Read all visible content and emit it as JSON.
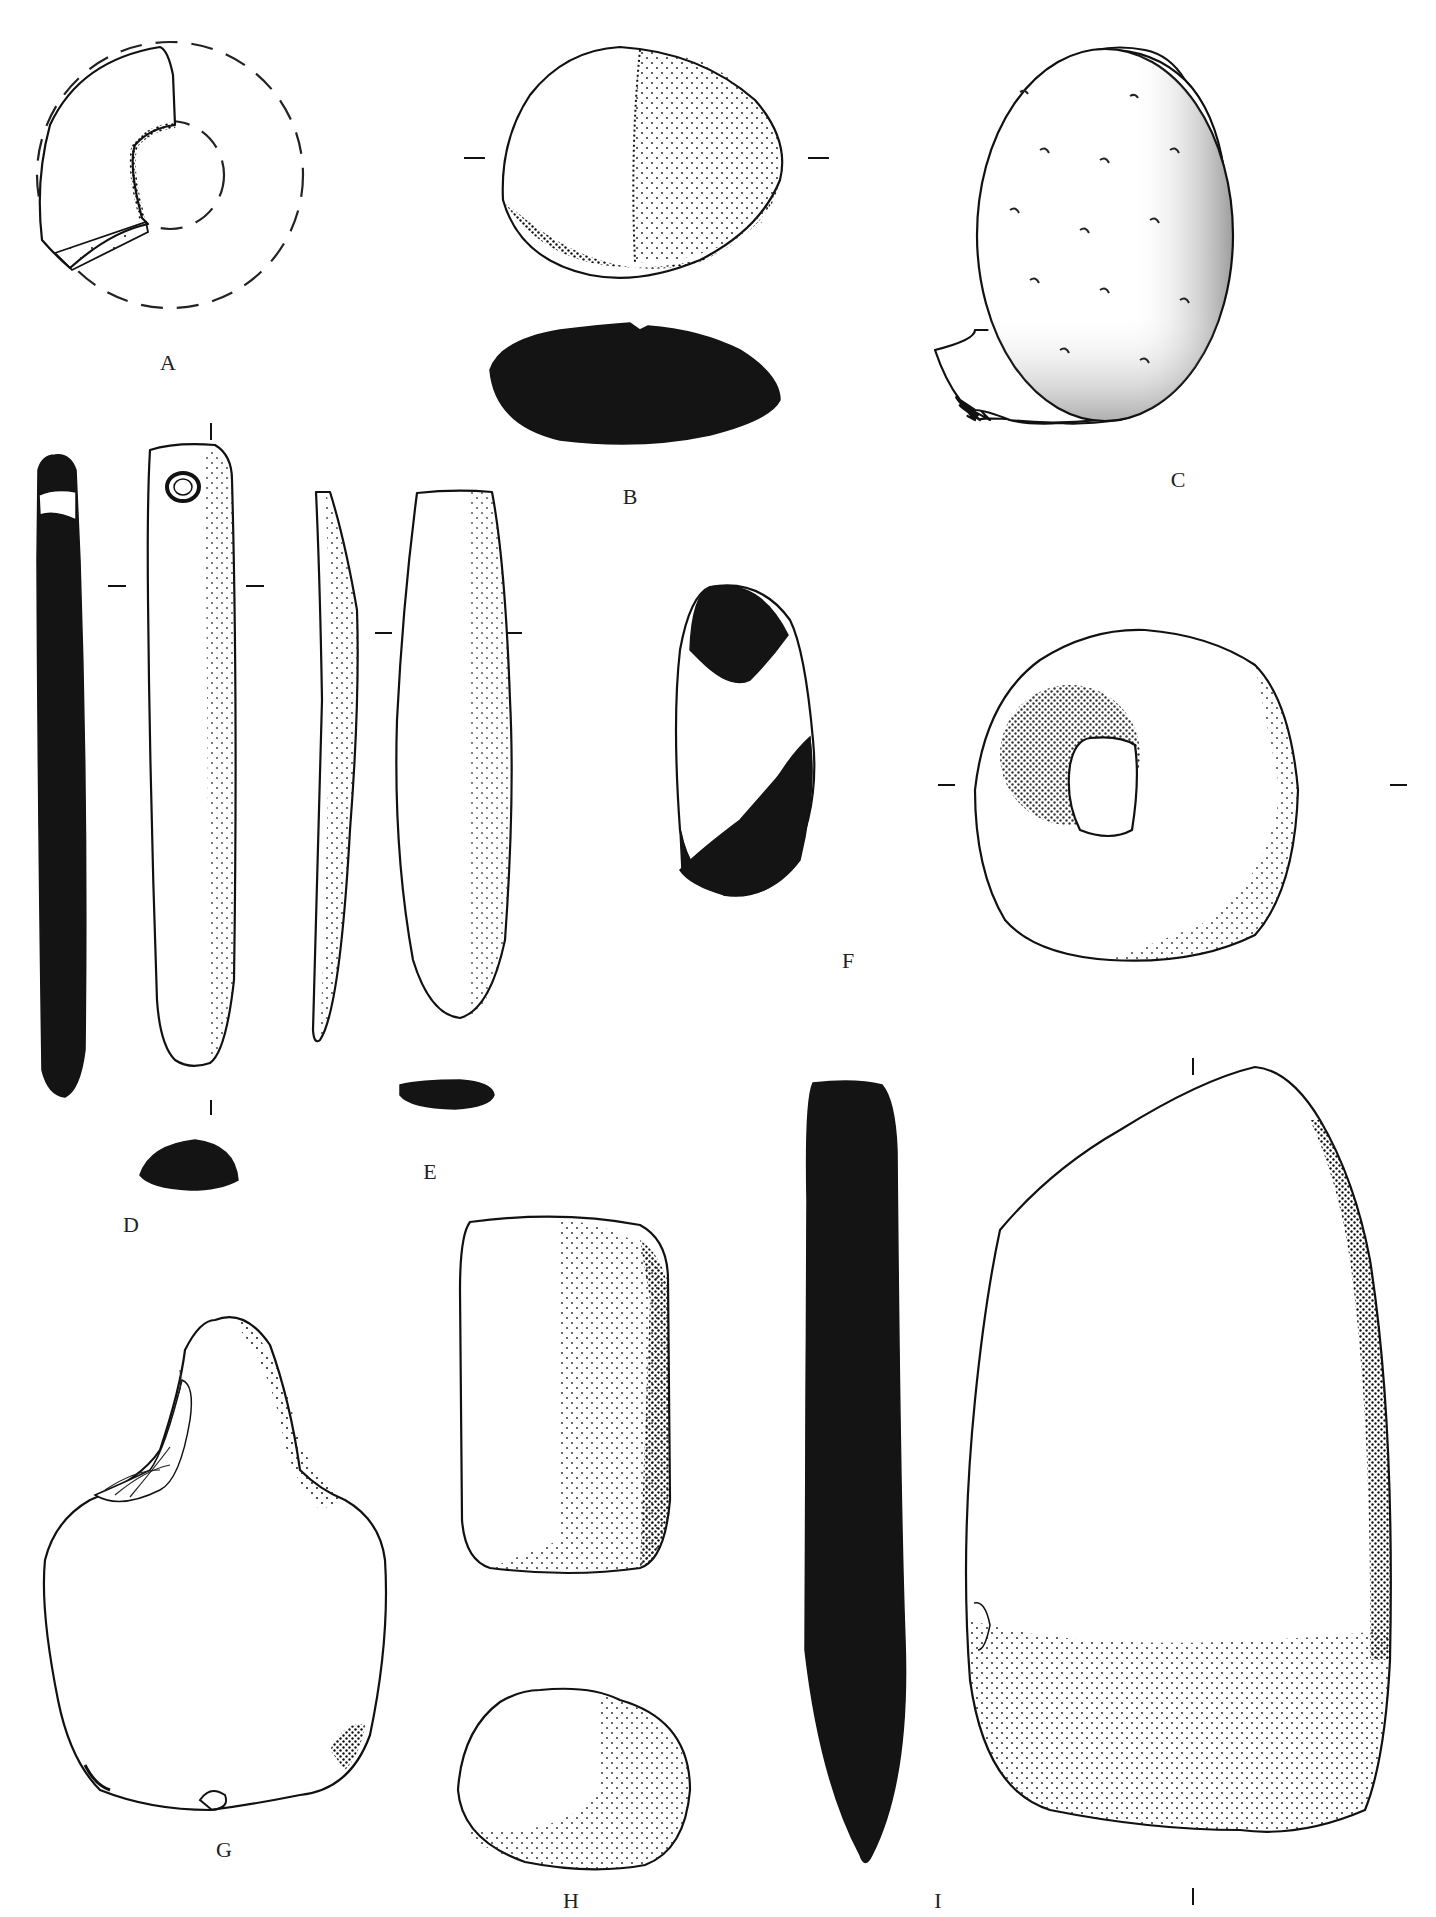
{
  "plate": {
    "type": "archaeological artifact illustration plate",
    "background": "#ffffff",
    "ink": "#141414"
  },
  "figures": [
    {
      "id": "A",
      "label": "A",
      "description": "fragment of perforated stone disc with dashed reconstruction outline"
    },
    {
      "id": "B",
      "label": "B",
      "description": "oval pebble, plan view stippled and solid black profile section"
    },
    {
      "id": "C",
      "label": "C",
      "description": "rounded stone with pitted surface, heavy stippling"
    },
    {
      "id": "D",
      "label": "D",
      "description": "elongated perforated pendant/whetstone with side profile and section"
    },
    {
      "id": "E",
      "label": "E",
      "description": "elongated tapering stone with side profile and section"
    },
    {
      "id": "F",
      "label": "F",
      "description": "perforated stone ring with black/white section"
    },
    {
      "id": "G",
      "label": "G",
      "description": "bell-shaped stone with flaked damage"
    },
    {
      "id": "H",
      "label": "H",
      "description": "rectangular rubbing stone with end view"
    },
    {
      "id": "I",
      "label": "I",
      "description": "large flat stone slab with black side section"
    }
  ]
}
